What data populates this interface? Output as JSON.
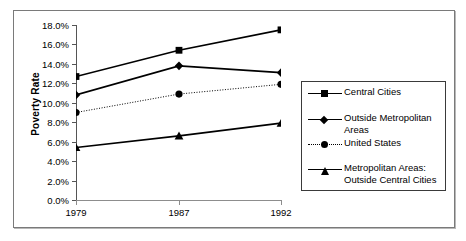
{
  "chart_data": {
    "type": "line",
    "title": "",
    "xlabel": "",
    "ylabel": "Poverty Rate",
    "categories": [
      "1979",
      "1987",
      "1992"
    ],
    "x_tick_labels": [
      "1979",
      "1987",
      "1992"
    ],
    "y_tick_labels": [
      "0.0%",
      "2.0%",
      "4.0%",
      "6.0%",
      "8.0%",
      "10.0%",
      "12.0%",
      "14.0%",
      "16.0%",
      "18.0%"
    ],
    "y_tick_values": [
      0,
      2,
      4,
      6,
      8,
      10,
      12,
      14,
      16,
      18
    ],
    "ylim": [
      0,
      18
    ],
    "grid": false,
    "legend_position": "right",
    "series": [
      {
        "name": "Central Cities",
        "marker": "square",
        "linestyle": "solid",
        "color": "#000000",
        "values": [
          12.7,
          15.4,
          17.5
        ]
      },
      {
        "name": "Outside Metropolitan Areas",
        "marker": "diamond",
        "linestyle": "solid",
        "color": "#000000",
        "values": [
          10.8,
          13.8,
          13.1
        ]
      },
      {
        "name": "United States",
        "marker": "circle",
        "linestyle": "dotted",
        "color": "#000000",
        "values": [
          9.0,
          10.9,
          11.9
        ]
      },
      {
        "name": "Metropolitan Areas: Outside Central Cities",
        "marker": "triangle",
        "linestyle": "solid",
        "color": "#000000",
        "values": [
          5.4,
          6.6,
          7.9
        ]
      }
    ]
  },
  "legend": {
    "entries": [
      {
        "label": "Central Cities"
      },
      {
        "label": "Outside Metropolitan\nAreas"
      },
      {
        "label": "United States"
      },
      {
        "label": "Metropolitan Areas:\nOutside Central Cities"
      }
    ]
  },
  "colors": {
    "ink": "#000000",
    "axis": "#555555",
    "frame": "#7a7a7a",
    "background": "#ffffff"
  }
}
